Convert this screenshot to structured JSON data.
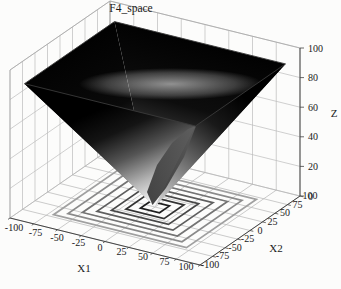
{
  "title": "F4_space",
  "axes": {
    "x1": {
      "label": "X1",
      "ticks": [
        -100,
        -75,
        -50,
        -25,
        0,
        25,
        50,
        75,
        100
      ]
    },
    "x2": {
      "label": "X2",
      "ticks": [
        -100,
        -75,
        -50,
        -25,
        0,
        25,
        50,
        75,
        100
      ]
    },
    "z": {
      "label": "Z",
      "ticks": [
        0,
        20,
        40,
        60,
        80,
        100
      ]
    }
  },
  "chart_data": {
    "type": "surface",
    "title": "F4_space",
    "function": "z = max(|x1|, |x2|)  (inverted square funnel with contour projection on base plane)",
    "x1_range": [
      -100,
      100
    ],
    "x2_range": [
      -100,
      100
    ],
    "z_range": [
      0,
      100
    ],
    "surface_extent": 90,
    "grid_step": 25,
    "z_grid_step": 20,
    "minimum_point": {
      "x1": 0,
      "x2": 0,
      "z": 0
    },
    "contour_levels": [
      10,
      20,
      30,
      40,
      50,
      60,
      70
    ],
    "contour_colors": [
      "#1f1f1f",
      "#333333",
      "#484848",
      "#5e5e5e",
      "#747474",
      "#8a8a8a",
      "#a0a0a0"
    ],
    "colormap": "gray (dark = high z at rim, light = low z at tip)",
    "grid_on": true,
    "colors": {
      "background": "#fcfcfb",
      "wall_grid": "#bcbcbc",
      "base_grid": "#b4b4b4",
      "box_edge": "#a8a8a8",
      "axis_line": "#444444",
      "text": "#1a1a1a"
    }
  }
}
